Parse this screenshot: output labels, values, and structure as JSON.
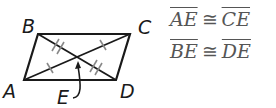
{
  "figure": {
    "shape": "parallelogram",
    "vertices": {
      "A": {
        "label": "A",
        "x": 24,
        "y": 80
      },
      "B": {
        "label": "B",
        "x": 38,
        "y": 34
      },
      "C": {
        "label": "C",
        "x": 130,
        "y": 34
      },
      "D": {
        "label": "D",
        "x": 116,
        "y": 80
      }
    },
    "intersection": {
      "label": "E",
      "x": 77,
      "y": 57
    },
    "stroke_color": "#1a1a1a",
    "tick_color": "#888888"
  },
  "statements": [
    {
      "left": "AE",
      "symbol": "≅",
      "right": "CE"
    },
    {
      "left": "BE",
      "symbol": "≅",
      "right": "DE"
    }
  ]
}
